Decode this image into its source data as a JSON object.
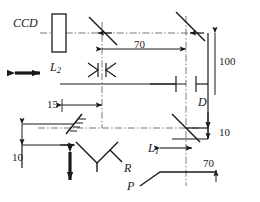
{
  "figure": {
    "type": "optical-layout-diagram",
    "title": "",
    "background": "#ffffff",
    "line_color": "#1a1a1a",
    "axis_color": "#555555"
  },
  "labels": {
    "ccd": "CCD",
    "lens2": "L",
    "lens2_sub": "2",
    "lens1": "L",
    "lens1_sub": "1",
    "retro": "R",
    "prism": "P",
    "aperture": "D"
  },
  "dimensions": {
    "d70_top": "70",
    "d100_right": "100",
    "d15_left": "15",
    "d10_left": "10",
    "d10_right": "10",
    "d70_bottom": "70"
  },
  "components": {
    "ccd_detector": "ccd-detector",
    "beamsplitter_top": "beamsplitter-top",
    "beamsplitter_bottom": "beamsplitter-bottom",
    "mirror_top_right": "mirror-top-right",
    "mirror_tilted_left": "mirror-tilted-left",
    "diverging_lens": "diverging-lens-l2",
    "aperture_slit": "aperture-slit-d",
    "retroreflector": "retroreflector-r",
    "prism_plate": "prism-plate-p",
    "arrow_translate_horizontal": "double-arrow-horizontal",
    "arrow_translate_vertical": "double-arrow-vertical"
  }
}
